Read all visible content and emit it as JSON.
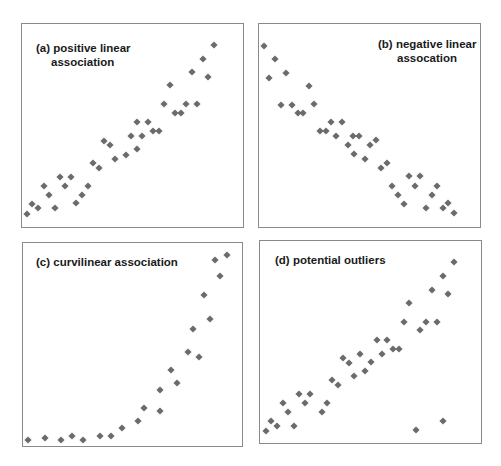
{
  "marker_color": "#6b6b6b",
  "border_color": "#8a8a8a",
  "chart_data": [
    {
      "type": "scatter",
      "title": "(a) positive linear association",
      "title_lines": [
        "(a) positive linear",
        "association"
      ],
      "xlabel": "",
      "ylabel": "",
      "grid": false,
      "legend": null,
      "marker": "diamond",
      "panel_box": {
        "left": 21,
        "top": 23,
        "width": 223,
        "height": 205
      },
      "points_px": [
        [
          27,
          214
        ],
        [
          32,
          204
        ],
        [
          38,
          208
        ],
        [
          44,
          186
        ],
        [
          49,
          195
        ],
        [
          55,
          208
        ],
        [
          60,
          177
        ],
        [
          65,
          186
        ],
        [
          71,
          177
        ],
        [
          76,
          203
        ],
        [
          82,
          195
        ],
        [
          88,
          186
        ],
        [
          93,
          163
        ],
        [
          99,
          168
        ],
        [
          104,
          141
        ],
        [
          110,
          145
        ],
        [
          115,
          159
        ],
        [
          126,
          155
        ],
        [
          131,
          136
        ],
        [
          137,
          149
        ],
        [
          137,
          122
        ],
        [
          142,
          136
        ],
        [
          148,
          122
        ],
        [
          153,
          131
        ],
        [
          159,
          131
        ],
        [
          164,
          104
        ],
        [
          170,
          85
        ],
        [
          175,
          113
        ],
        [
          181,
          113
        ],
        [
          186,
          104
        ],
        [
          197,
          104
        ],
        [
          192,
          72
        ],
        [
          203,
          59
        ],
        [
          208,
          77
        ],
        [
          214,
          45
        ]
      ]
    },
    {
      "type": "scatter",
      "title": "(b) negative linear assocation",
      "title_lines": [
        "(b) negative linear",
        "assocation"
      ],
      "xlabel": "",
      "ylabel": "",
      "grid": false,
      "legend": null,
      "marker": "diamond",
      "panel_box": {
        "left": 258,
        "top": 23,
        "width": 223,
        "height": 205
      },
      "points_px": [
        [
          264,
          46
        ],
        [
          269,
          78
        ],
        [
          275,
          59
        ],
        [
          281,
          105
        ],
        [
          286,
          73
        ],
        [
          292,
          105
        ],
        [
          298,
          113
        ],
        [
          303,
          113
        ],
        [
          309,
          86
        ],
        [
          314,
          104
        ],
        [
          320,
          131
        ],
        [
          326,
          131
        ],
        [
          331,
          122
        ],
        [
          336,
          136
        ],
        [
          342,
          122
        ],
        [
          348,
          145
        ],
        [
          353,
          136
        ],
        [
          359,
          136
        ],
        [
          354,
          154
        ],
        [
          365,
          159
        ],
        [
          370,
          145
        ],
        [
          376,
          140
        ],
        [
          381,
          168
        ],
        [
          387,
          163
        ],
        [
          392,
          186
        ],
        [
          398,
          195
        ],
        [
          404,
          204
        ],
        [
          409,
          176
        ],
        [
          415,
          186
        ],
        [
          420,
          176
        ],
        [
          426,
          208
        ],
        [
          432,
          195
        ],
        [
          437,
          186
        ],
        [
          443,
          208
        ],
        [
          448,
          203
        ],
        [
          454,
          213
        ]
      ]
    },
    {
      "type": "scatter",
      "title": "(c) curvilinear association",
      "title_lines": [
        "(c) curvilinear association"
      ],
      "xlabel": "",
      "ylabel": "",
      "grid": false,
      "legend": null,
      "marker": "diamond",
      "panel_box": {
        "left": 22,
        "top": 242,
        "width": 221,
        "height": 205
      },
      "points_px": [
        [
          28,
          440
        ],
        [
          45,
          438
        ],
        [
          61,
          440
        ],
        [
          72,
          436
        ],
        [
          83,
          440
        ],
        [
          100,
          436
        ],
        [
          111,
          436
        ],
        [
          122,
          428
        ],
        [
          138,
          421
        ],
        [
          144,
          408
        ],
        [
          160,
          411
        ],
        [
          160,
          390
        ],
        [
          171,
          370
        ],
        [
          177,
          383
        ],
        [
          188,
          352
        ],
        [
          199,
          357
        ],
        [
          193,
          329
        ],
        [
          210,
          319
        ],
        [
          204,
          295
        ],
        [
          220,
          276
        ],
        [
          215,
          260
        ],
        [
          227,
          255
        ]
      ]
    },
    {
      "type": "scatter",
      "title": "(d) potential outliers",
      "title_lines": [
        "(d) potential outliers"
      ],
      "xlabel": "",
      "ylabel": "",
      "grid": false,
      "legend": null,
      "marker": "diamond",
      "panel_box": {
        "left": 259,
        "top": 240,
        "width": 223,
        "height": 204
      },
      "points_px": [
        [
          266,
          431
        ],
        [
          271,
          421
        ],
        [
          277,
          426
        ],
        [
          283,
          403
        ],
        [
          288,
          412
        ],
        [
          294,
          426
        ],
        [
          299,
          394
        ],
        [
          305,
          403
        ],
        [
          310,
          394
        ],
        [
          322,
          412
        ],
        [
          327,
          403
        ],
        [
          332,
          380
        ],
        [
          338,
          385
        ],
        [
          343,
          358
        ],
        [
          349,
          363
        ],
        [
          354,
          376
        ],
        [
          360,
          354
        ],
        [
          365,
          371
        ],
        [
          371,
          362
        ],
        [
          377,
          340
        ],
        [
          382,
          354
        ],
        [
          387,
          340
        ],
        [
          393,
          349
        ],
        [
          399,
          349
        ],
        [
          404,
          322
        ],
        [
          409,
          303
        ],
        [
          420,
          330
        ],
        [
          426,
          322
        ],
        [
          432,
          290
        ],
        [
          437,
          322
        ],
        [
          443,
          276
        ],
        [
          448,
          294
        ],
        [
          454,
          262
        ],
        [
          416,
          430
        ],
        [
          443,
          421
        ]
      ],
      "outliers_px": [
        [
          416,
          430
        ],
        [
          443,
          421
        ]
      ]
    }
  ]
}
